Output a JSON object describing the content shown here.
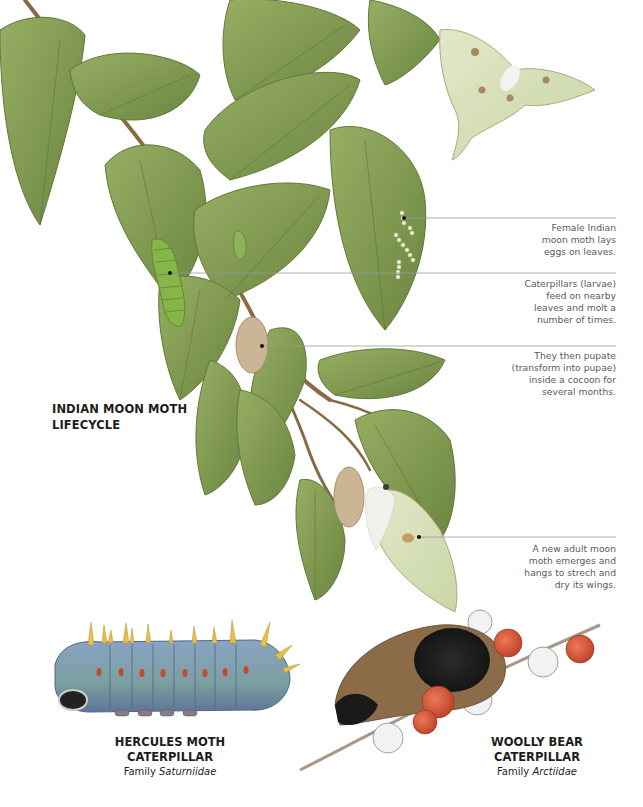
{
  "diagram": {
    "title_lines": [
      "INDIAN MOON MOTH",
      "LIFECYCLE"
    ],
    "stages": [
      {
        "id": "eggs",
        "lines": [
          "Female Indian",
          "moon moth lays",
          "eggs on leaves."
        ]
      },
      {
        "id": "larvae",
        "lines": [
          "Caterpillars (larvae)",
          "feed on nearby",
          "leaves and molt a",
          "number of times."
        ]
      },
      {
        "id": "pupae",
        "lines": [
          "They then pupate",
          "(transform into pupae)",
          "inside a cocoon for",
          "several months."
        ]
      },
      {
        "id": "adult",
        "lines": [
          "A new adult moon",
          "moth emerges and",
          "hangs to strech and",
          "dry its wings."
        ]
      }
    ],
    "specimens": [
      {
        "id": "hercules",
        "name": "HERCULES MOTH CATERPILLAR",
        "family_prefix": "Family ",
        "family": "Saturniidae"
      },
      {
        "id": "woolly-bear",
        "name": "WOOLLY BEAR CATERPILLAR",
        "family_prefix": "Family ",
        "family": "Arctiidae"
      }
    ],
    "colors": {
      "leaf": "#7f9a4e",
      "leaf_dark": "#5f7a38",
      "stem": "#8a6a45",
      "moth_wing": "#d6dfb8",
      "cocoon": "#cbb594",
      "caterpillar_green": "#86b54a",
      "hercules_blue": "#7f97b8",
      "berry": "#d9573a",
      "leader_line": "#9a9a9a"
    }
  }
}
